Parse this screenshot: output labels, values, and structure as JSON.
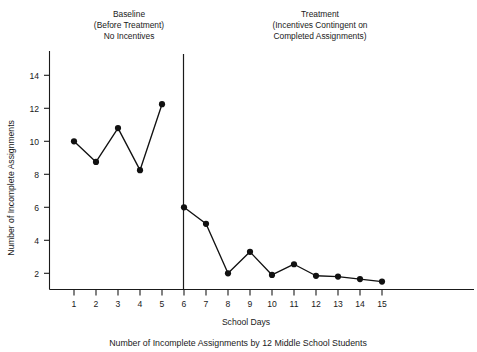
{
  "chart_data": {
    "type": "line",
    "title": "",
    "caption": "Number of Incomplete Assignments by 12 Middle School Students",
    "xlabel": "School Days",
    "ylabel": "Number of Incomplete Assignments",
    "xlim": [
      0.3,
      15.9
    ],
    "ylim": [
      1.05,
      14.9
    ],
    "grid": false,
    "legend": "none",
    "x": [
      1,
      2,
      3,
      4,
      5,
      6,
      7,
      8,
      9,
      10,
      11,
      12,
      13,
      14,
      15
    ],
    "xtick_labels": [
      "1",
      "2",
      "3",
      "4",
      "5",
      "6",
      "7",
      "8",
      "9",
      "10",
      "11",
      "12",
      "13",
      "14",
      "15"
    ],
    "ytick_values": [
      2,
      4,
      6,
      8,
      10,
      12,
      14
    ],
    "ytick_labels": [
      "2",
      "4",
      "6",
      "8",
      "10",
      "12",
      "14"
    ],
    "series": [
      {
        "name": "Baseline (Before Treatment) No Incentives",
        "x": [
          1,
          2,
          3,
          4,
          5
        ],
        "values": [
          10.0,
          8.75,
          10.8,
          8.25,
          12.25
        ]
      },
      {
        "name": "Treatment (Incentives Contingent on Completed Assignments)",
        "x": [
          6,
          7,
          8,
          9,
          10,
          11,
          12,
          13,
          14,
          15
        ],
        "values": [
          6.0,
          5.0,
          2.0,
          3.3,
          1.9,
          2.55,
          1.85,
          1.8,
          1.65,
          1.5
        ]
      }
    ],
    "phase_divider_x": 5.6,
    "annotations": [
      {
        "name": "baseline-phase-title",
        "lines": [
          "Baseline",
          "(Before Treatment)",
          "No Incentives"
        ],
        "x_center": 129,
        "y_top": 17
      },
      {
        "name": "treatment-phase-title",
        "lines": [
          "Treatment",
          "(Incentives Contingent on",
          "Completed Assignments)"
        ],
        "x_center": 320,
        "y_top": 17
      }
    ]
  },
  "colors": {
    "ink": "#1a1a1a",
    "marker": "#111111",
    "background": "#ffffff"
  }
}
